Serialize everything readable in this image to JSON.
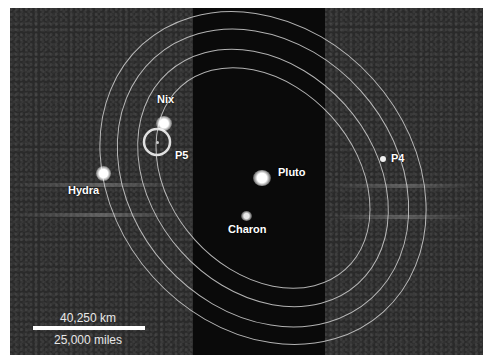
{
  "image": {
    "description": "Hubble image of Pluto system with moon orbits",
    "background_color": "#2a2a2a",
    "band_color": "#0a0a0a",
    "orbit_color": "#d0d0d0"
  },
  "bodies": [
    {
      "name": "Pluto",
      "label": "Pluto"
    },
    {
      "name": "Charon",
      "label": "Charon"
    },
    {
      "name": "Nix",
      "label": "Nix"
    },
    {
      "name": "Hydra",
      "label": "Hydra"
    },
    {
      "name": "P4",
      "label": "P4"
    },
    {
      "name": "P5",
      "label": "P5"
    }
  ],
  "scale": {
    "km_label": "40,250 km",
    "miles_label": "25,000 miles"
  }
}
